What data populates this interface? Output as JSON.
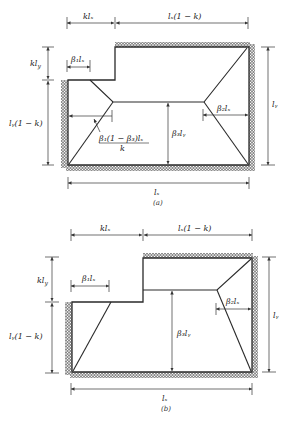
{
  "figure": {
    "panels": [
      {
        "id": "a",
        "caption": "(a)",
        "labels": {
          "top_left_dim": "klₓ",
          "top_right_dim": "lₓ(1 − k)",
          "left_top_dim": "kl",
          "left_top_dim_sub": "y",
          "left_bottom_dim": "lᵧ(1 − k)",
          "beta1": "β₁lₓ",
          "beta2": "β₂lₓ",
          "beta3": "β₃lᵧ",
          "right_dim": "lᵧ",
          "bottom_dim": "lₓ",
          "formula_num": "β₁(1 − β₃)lₓ",
          "formula_den": "k"
        }
      },
      {
        "id": "b",
        "caption": "(b)",
        "labels": {
          "top_left_dim": "klₓ",
          "top_right_dim": "lₓ(1 − k)",
          "left_top_dim": "kl",
          "left_top_dim_sub": "y",
          "left_bottom_dim": "lᵧ(1 − k)",
          "beta1": "β₁lₓ",
          "beta2": "β₂lₓ",
          "beta3": "β₃lᵧ",
          "right_dim": "lᵧ",
          "bottom_dim": "lₓ"
        }
      }
    ],
    "colors": {
      "line": "#2a2a2a",
      "hatch": "#3a3a3a",
      "background": "#ffffff"
    }
  }
}
